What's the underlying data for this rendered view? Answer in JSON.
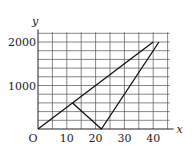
{
  "chart_data": {
    "type": "line",
    "title": "",
    "xlabel": "x",
    "ylabel": "y",
    "origin_label": "O",
    "xlim": [
      0,
      45
    ],
    "ylim": [
      0,
      2200
    ],
    "grid": true,
    "x_grid_step": 5,
    "y_grid_step": 200,
    "x_ticks": [
      10,
      20,
      30,
      40
    ],
    "x_tick_labels": [
      "10",
      "20",
      "30",
      "40"
    ],
    "y_ticks": [
      1000,
      2000
    ],
    "y_tick_labels": [
      "1000",
      "2000"
    ],
    "series": [
      {
        "name": "line-1",
        "points": [
          [
            0,
            0
          ],
          [
            40,
            2000
          ]
        ]
      },
      {
        "name": "line-2",
        "points": [
          [
            12,
            600
          ],
          [
            22,
            0
          ],
          [
            42,
            2000
          ]
        ]
      }
    ]
  }
}
